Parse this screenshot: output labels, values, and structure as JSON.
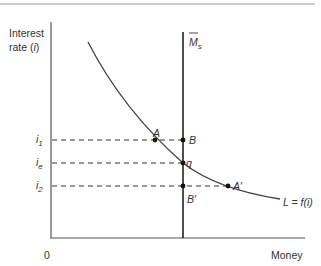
{
  "figure": {
    "y_axis_label_line1": "Interest",
    "y_axis_label_line2_prefix": "rate (",
    "y_axis_label_line2_var": "i",
    "y_axis_label_line2_suffix": ")",
    "x_axis_label": "Money",
    "origin_label": "0",
    "money_supply_label": "M",
    "money_supply_sub": "s",
    "demand_curve_label": "L = f(i)",
    "rate_labels": {
      "i1": {
        "base": "i",
        "sub": "1"
      },
      "ie": {
        "base": "i",
        "sub": "e"
      },
      "i2": {
        "base": "i",
        "sub": "2"
      }
    },
    "points": {
      "A": "A",
      "B": "B",
      "q": "q",
      "B_prime": "B′",
      "A_prime": "A′"
    },
    "colors": {
      "axis": "#555555",
      "curve": "#444444",
      "supply_line": "#222222",
      "dash": "#333333",
      "top_rule": "#9a9a9a"
    }
  }
}
